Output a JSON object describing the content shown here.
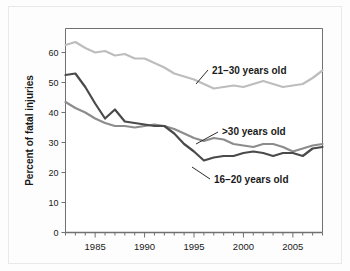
{
  "chart_data": {
    "type": "line",
    "title": "",
    "xlabel": "",
    "ylabel": "Percent of fatal injuries",
    "xlim": [
      1982,
      2008
    ],
    "ylim": [
      0,
      68
    ],
    "grid": false,
    "legend_position": "inline-annotations",
    "x_ticks_major": [
      1985,
      1990,
      1995,
      2000,
      2005
    ],
    "x_tick_labels": [
      "1985",
      "1990",
      "1995",
      "2000",
      "2005"
    ],
    "x_ticks_minor_step": 1,
    "y_ticks": [
      0,
      10,
      20,
      30,
      40,
      50,
      60
    ],
    "y_tick_labels": [
      "0",
      "10",
      "20",
      "30",
      "40",
      "50",
      "60"
    ],
    "x": [
      1982,
      1983,
      1984,
      1985,
      1986,
      1987,
      1988,
      1989,
      1990,
      1991,
      1992,
      1993,
      1994,
      1995,
      1996,
      1997,
      1998,
      1999,
      2000,
      2001,
      2002,
      2003,
      2004,
      2005,
      2006,
      2007,
      2008
    ],
    "series": [
      {
        "name": "21-30 years old",
        "label": "21–30 years old",
        "color": "#bdbdbd",
        "values": [
          62.5,
          63.5,
          61.5,
          60.0,
          60.5,
          59.0,
          59.5,
          58.0,
          58.0,
          56.5,
          55.0,
          53.0,
          52.0,
          51.0,
          49.5,
          48.0,
          48.5,
          49.0,
          48.5,
          49.5,
          50.5,
          49.5,
          48.5,
          49.0,
          49.5,
          51.5,
          54.0
        ]
      },
      {
        "name": "16-20 years old",
        "label": "16–20 years old",
        "color": "#4a4a4a",
        "values": [
          52.5,
          53.0,
          48.5,
          43.0,
          38.0,
          41.0,
          37.0,
          36.5,
          36.0,
          35.5,
          35.5,
          33.0,
          29.5,
          27.0,
          24.0,
          25.0,
          25.5,
          25.5,
          26.5,
          27.0,
          26.5,
          25.5,
          26.5,
          26.5,
          25.5,
          28.0,
          28.5
        ]
      },
      {
        "name": ">30 years old",
        "label": ">30 years old",
        "color": "#8c8c8c",
        "values": [
          43.5,
          41.5,
          40.0,
          38.0,
          36.5,
          35.5,
          35.5,
          35.0,
          35.5,
          36.0,
          35.5,
          34.5,
          33.0,
          31.5,
          30.5,
          31.5,
          31.0,
          29.5,
          29.0,
          28.5,
          29.5,
          29.5,
          28.5,
          27.0,
          28.0,
          29.0,
          29.5
        ]
      }
    ],
    "annotations": [
      {
        "text": "21–30 years old",
        "series": "21-30 years old",
        "anchor_year": 1996.5,
        "anchor_value": 49.0
      },
      {
        "text": ">30 years old",
        "series": ">30 years old",
        "anchor_year": 1997.5,
        "anchor_value": 31.2
      },
      {
        "text": "16–20 years old",
        "series": "16-20 years old",
        "anchor_year": 1995.5,
        "anchor_value": 24.2
      }
    ]
  },
  "style": {
    "axis_color": "#707070",
    "text_color": "#1a1a1a",
    "plot_background": "#ffffff",
    "figure_background": "#fdfdfd",
    "figure_border_color": "#e9e9e9"
  }
}
